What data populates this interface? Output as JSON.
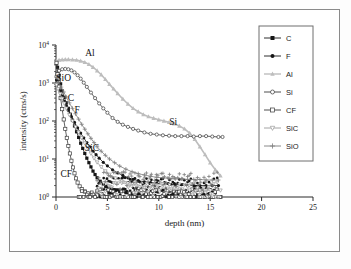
{
  "figure": {
    "background": "#ffffff",
    "frame_color": "#8a8a8a"
  },
  "axes": {
    "x_title": "depth (nm)",
    "y_title": "intensity (ctns/s)",
    "x_ticks": [
      "0",
      "5",
      "10",
      "15",
      "20",
      "25"
    ],
    "y_ticks": [
      "0",
      "1",
      "2",
      "3",
      "4"
    ],
    "y_mantissa": "10"
  },
  "legend": {
    "items": [
      {
        "label": "C",
        "marker": "filled-square",
        "color": "#161616"
      },
      {
        "label": "F",
        "marker": "filled-circle",
        "color": "#161616"
      },
      {
        "label": "Al",
        "marker": "filled-triangle-up",
        "color": "#bdbdbd"
      },
      {
        "label": "Si",
        "marker": "open-circle",
        "color": "#3a3a3a"
      },
      {
        "label": "CF",
        "marker": "open-square",
        "color": "#3a3a3a"
      },
      {
        "label": "SiC",
        "marker": "open-triangle-down",
        "color": "#9a9a9a"
      },
      {
        "label": "SiO",
        "marker": "plus",
        "color": "#7d7d7d"
      }
    ]
  },
  "annotations": [
    {
      "text": "Al",
      "x": 3.3,
      "y": 5200
    },
    {
      "text": "SiO",
      "x": 0.75,
      "y": 1150
    },
    {
      "text": "C",
      "x": 1.45,
      "y": 330
    },
    {
      "text": "F",
      "x": 2.05,
      "y": 165
    },
    {
      "text": "SiC",
      "x": 3.5,
      "y": 16
    },
    {
      "text": "CF",
      "x": 1.0,
      "y": 3.4
    },
    {
      "text": "Si",
      "x": 11.4,
      "y": 78
    }
  ],
  "chart_data": {
    "type": "line",
    "title": "",
    "xlabel": "depth (nm)",
    "ylabel": "intensity (ctns/s)",
    "xlim": [
      0,
      25
    ],
    "ylim": [
      1,
      10000
    ],
    "yscale": "log",
    "grid": false,
    "legend_position": "right",
    "series": [
      {
        "name": "C",
        "marker": "filled-square",
        "color": "#161616",
        "x": [
          0.05,
          0.15,
          0.3,
          0.45,
          0.6,
          0.8,
          1.0,
          1.2,
          1.4,
          1.6,
          1.8,
          2.0,
          2.2,
          2.4,
          2.6,
          2.8,
          3.0,
          3.2,
          3.4,
          3.6,
          3.8,
          4.0,
          4.3,
          4.6,
          5.0,
          5.4,
          5.8,
          6.2,
          6.8,
          7.4,
          8.0,
          8.8,
          9.6,
          10.4,
          11.2,
          12.0,
          12.8,
          13.6,
          14.4,
          15.2,
          16.0
        ],
        "y": [
          3300,
          2600,
          1600,
          950,
          620,
          420,
          300,
          215,
          150,
          105,
          74,
          52,
          37,
          26,
          19,
          14,
          10.5,
          8.0,
          6.2,
          4.8,
          3.9,
          3.2,
          2.6,
          2.2,
          1.9,
          1.7,
          1.5,
          1.4,
          1.3,
          1.2,
          1.2,
          1.15,
          1.1,
          1.1,
          1.1,
          1.05,
          1.05,
          1.0,
          1.0,
          1.0,
          1.0
        ]
      },
      {
        "name": "F",
        "marker": "filled-circle",
        "color": "#161616",
        "x": [
          0.05,
          0.2,
          0.4,
          0.6,
          0.8,
          1.0,
          1.2,
          1.5,
          1.8,
          2.1,
          2.4,
          2.7,
          3.0,
          3.3,
          3.6,
          3.9,
          4.2,
          4.6,
          5.0,
          5.5,
          6.0,
          6.5,
          7.0,
          7.5,
          8.0,
          8.6,
          9.2,
          9.8,
          10.4,
          11.0,
          11.6,
          12.2,
          12.8,
          13.4,
          14.0,
          14.6,
          15.2,
          15.8
        ],
        "y": [
          1200,
          880,
          620,
          450,
          330,
          250,
          190,
          130,
          92,
          66,
          48,
          36,
          27,
          21,
          16,
          13,
          10.5,
          8.2,
          6.6,
          5.2,
          4.3,
          3.7,
          3.2,
          2.9,
          2.7,
          2.5,
          2.4,
          2.3,
          2.2,
          2.2,
          2.1,
          2.1,
          2.0,
          2.0,
          2.0,
          2.0,
          2.0,
          2.0
        ]
      },
      {
        "name": "Al",
        "marker": "filled-triangle-up",
        "color": "#bdbdbd",
        "x": [
          0.05,
          0.3,
          0.6,
          0.9,
          1.2,
          1.6,
          2.0,
          2.4,
          2.8,
          3.2,
          3.6,
          4.0,
          4.4,
          4.8,
          5.2,
          5.6,
          6.0,
          6.5,
          7.0,
          7.5,
          8.0,
          8.5,
          9.0,
          9.5,
          10.0,
          10.5,
          11.0,
          11.5,
          12.0,
          12.5,
          13.0,
          13.5,
          14.0,
          14.5,
          15.0,
          15.5,
          16.0
        ],
        "y": [
          3800,
          4000,
          4100,
          4150,
          4150,
          4100,
          4000,
          3800,
          3500,
          3100,
          2600,
          2100,
          1650,
          1250,
          930,
          700,
          530,
          380,
          280,
          215,
          175,
          148,
          130,
          118,
          108,
          100,
          92,
          84,
          74,
          62,
          48,
          33,
          21,
          13,
          8.0,
          5.2,
          3.6
        ]
      },
      {
        "name": "Si",
        "marker": "open-circle",
        "color": "#3a3a3a",
        "x": [
          0.05,
          0.3,
          0.6,
          0.9,
          1.2,
          1.5,
          1.8,
          2.1,
          2.4,
          2.7,
          3.0,
          3.4,
          3.8,
          4.2,
          4.6,
          5.0,
          5.5,
          6.0,
          6.5,
          7.0,
          7.5,
          8.0,
          8.6,
          9.2,
          9.8,
          10.4,
          11.0,
          11.6,
          12.2,
          12.8,
          13.4,
          14.0,
          14.6,
          15.2,
          15.8,
          16.2
        ],
        "y": [
          1500,
          2100,
          2300,
          2350,
          2300,
          2150,
          1900,
          1600,
          1300,
          1020,
          790,
          560,
          400,
          290,
          215,
          165,
          120,
          95,
          80,
          70,
          62,
          56,
          50,
          46,
          44,
          42,
          41,
          40,
          40,
          40,
          39,
          40,
          40,
          39,
          38,
          38
        ]
      },
      {
        "name": "CF",
        "marker": "open-square",
        "color": "#3a3a3a",
        "x": [
          0.05,
          0.15,
          0.3,
          0.45,
          0.6,
          0.75,
          0.9,
          1.05,
          1.2,
          1.35,
          1.5,
          1.65,
          1.8,
          1.95,
          2.1,
          2.3,
          2.5,
          2.8,
          3.1,
          3.5,
          4.0,
          4.6,
          5.2,
          6.0,
          6.8,
          7.6,
          8.4,
          9.2,
          10.0,
          11.0,
          12.0,
          13.0,
          14.0,
          15.0,
          16.0
        ],
        "y": [
          3400,
          1700,
          800,
          400,
          205,
          110,
          62,
          36,
          22,
          14,
          9.0,
          6.0,
          4.2,
          3.1,
          2.4,
          1.9,
          1.6,
          1.4,
          1.25,
          1.15,
          1.1,
          1.05,
          1.05,
          1.0,
          1.0,
          1.0,
          1.0,
          1.0,
          1.0,
          1.0,
          1.0,
          1.0,
          1.0,
          1.0,
          1.0
        ]
      },
      {
        "name": "SiC",
        "marker": "open-triangle-down",
        "color": "#9a9a9a",
        "x": [
          0.05,
          0.2,
          0.4,
          0.6,
          0.8,
          1.0,
          1.3,
          1.6,
          1.9,
          2.2,
          2.5,
          2.8,
          3.1,
          3.4,
          3.7,
          4.0,
          4.4,
          4.8,
          5.2,
          5.8,
          6.4,
          7.0,
          7.8,
          8.6,
          9.4,
          10.2,
          11.0,
          12.0,
          13.0,
          14.0,
          15.0,
          16.0
        ],
        "y": [
          900,
          700,
          520,
          390,
          290,
          215,
          145,
          100,
          70,
          50,
          36,
          26,
          19,
          14,
          10.5,
          8.2,
          6.2,
          4.8,
          3.9,
          3.1,
          2.6,
          2.3,
          2.0,
          1.9,
          1.8,
          1.7,
          1.6,
          1.6,
          1.5,
          1.5,
          1.5,
          1.5
        ]
      },
      {
        "name": "SiO",
        "marker": "plus",
        "color": "#7d7d7d",
        "x": [
          0.05,
          0.25,
          0.5,
          0.75,
          1.0,
          1.3,
          1.6,
          1.9,
          2.2,
          2.5,
          2.8,
          3.1,
          3.4,
          3.7,
          4.0,
          4.4,
          4.8,
          5.2,
          5.7,
          6.2,
          6.8,
          7.4,
          8.0,
          8.6,
          9.2,
          9.8,
          10.4,
          11.0,
          11.6,
          12.2,
          12.8,
          13.4,
          14.0,
          14.6,
          15.2,
          15.8
        ],
        "y": [
          1400,
          1050,
          780,
          580,
          430,
          300,
          215,
          155,
          112,
          82,
          61,
          46,
          35,
          27,
          21,
          16,
          12.5,
          10.0,
          8.0,
          6.5,
          5.4,
          4.6,
          4.1,
          3.8,
          3.5,
          3.3,
          3.2,
          3.1,
          3.0,
          3.0,
          2.9,
          2.9,
          2.9,
          2.8,
          2.8,
          2.8
        ]
      }
    ]
  }
}
